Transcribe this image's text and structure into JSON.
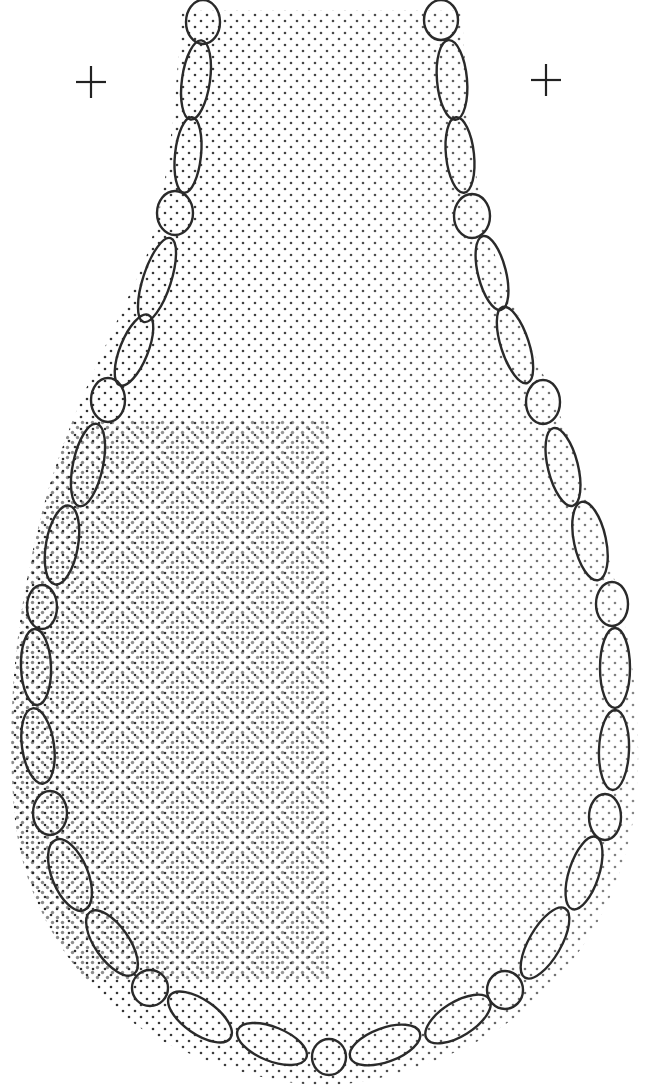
{
  "figure": {
    "title": "",
    "ink_color": "#2a2a2a",
    "background": "#ffffff",
    "registration_marks": [
      {
        "name": "left-crosshair",
        "x": 91,
        "y": 82
      },
      {
        "name": "right-crosshair",
        "x": 546,
        "y": 80
      }
    ],
    "cells_left": [
      {
        "cx": 203,
        "cy": 22,
        "rx": 17,
        "ry": 22,
        "rot": 0
      },
      {
        "cx": 196,
        "cy": 80,
        "rx": 14,
        "ry": 40,
        "rot": 8
      },
      {
        "cx": 188,
        "cy": 155,
        "rx": 13,
        "ry": 38,
        "rot": 6
      },
      {
        "cx": 175,
        "cy": 213,
        "rx": 18,
        "ry": 22,
        "rot": 0
      },
      {
        "cx": 157,
        "cy": 280,
        "rx": 14,
        "ry": 44,
        "rot": 18
      },
      {
        "cx": 134,
        "cy": 350,
        "rx": 14,
        "ry": 38,
        "rot": 22
      },
      {
        "cx": 108,
        "cy": 400,
        "rx": 17,
        "ry": 22,
        "rot": 0
      },
      {
        "cx": 88,
        "cy": 465,
        "rx": 15,
        "ry": 42,
        "rot": 12
      },
      {
        "cx": 62,
        "cy": 545,
        "rx": 16,
        "ry": 40,
        "rot": 10
      },
      {
        "cx": 42,
        "cy": 607,
        "rx": 15,
        "ry": 22,
        "rot": 0
      },
      {
        "cx": 36,
        "cy": 667,
        "rx": 15,
        "ry": 38,
        "rot": -2
      },
      {
        "cx": 38,
        "cy": 746,
        "rx": 16,
        "ry": 38,
        "rot": -8
      },
      {
        "cx": 50,
        "cy": 813,
        "rx": 17,
        "ry": 22,
        "rot": 0
      },
      {
        "cx": 70,
        "cy": 875,
        "rx": 18,
        "ry": 38,
        "rot": -22
      },
      {
        "cx": 112,
        "cy": 943,
        "rx": 17,
        "ry": 38,
        "rot": -35
      },
      {
        "cx": 150,
        "cy": 988,
        "rx": 18,
        "ry": 18,
        "rot": 0
      },
      {
        "cx": 200,
        "cy": 1017,
        "rx": 17,
        "ry": 37,
        "rot": -55
      },
      {
        "cx": 272,
        "cy": 1044,
        "rx": 17,
        "ry": 37,
        "rot": -68
      }
    ],
    "cells_bottom": [
      {
        "cx": 329,
        "cy": 1057,
        "rx": 17,
        "ry": 18,
        "rot": 0
      }
    ],
    "cells_right": [
      {
        "cx": 441,
        "cy": 20,
        "rx": 17,
        "ry": 20,
        "rot": 0
      },
      {
        "cx": 452,
        "cy": 80,
        "rx": 15,
        "ry": 40,
        "rot": -5
      },
      {
        "cx": 460,
        "cy": 155,
        "rx": 14,
        "ry": 38,
        "rot": -6
      },
      {
        "cx": 472,
        "cy": 216,
        "rx": 18,
        "ry": 22,
        "rot": 0
      },
      {
        "cx": 492,
        "cy": 273,
        "rx": 14,
        "ry": 38,
        "rot": -14
      },
      {
        "cx": 515,
        "cy": 345,
        "rx": 14,
        "ry": 40,
        "rot": -18
      },
      {
        "cx": 543,
        "cy": 402,
        "rx": 17,
        "ry": 22,
        "rot": 0
      },
      {
        "cx": 563,
        "cy": 467,
        "rx": 15,
        "ry": 40,
        "rot": -14
      },
      {
        "cx": 590,
        "cy": 541,
        "rx": 16,
        "ry": 40,
        "rot": -12
      },
      {
        "cx": 612,
        "cy": 604,
        "rx": 16,
        "ry": 22,
        "rot": 0
      },
      {
        "cx": 615,
        "cy": 668,
        "rx": 15,
        "ry": 40,
        "rot": 0
      },
      {
        "cx": 614,
        "cy": 750,
        "rx": 15,
        "ry": 40,
        "rot": 2
      },
      {
        "cx": 605,
        "cy": 817,
        "rx": 16,
        "ry": 23,
        "rot": 0
      },
      {
        "cx": 584,
        "cy": 873,
        "rx": 15,
        "ry": 38,
        "rot": 18
      },
      {
        "cx": 545,
        "cy": 943,
        "rx": 16,
        "ry": 40,
        "rot": 30
      },
      {
        "cx": 505,
        "cy": 990,
        "rx": 18,
        "ry": 19,
        "rot": 0
      },
      {
        "cx": 458,
        "cy": 1019,
        "rx": 17,
        "ry": 37,
        "rot": 58
      },
      {
        "cx": 385,
        "cy": 1045,
        "rx": 17,
        "ry": 37,
        "rot": 70
      }
    ]
  }
}
